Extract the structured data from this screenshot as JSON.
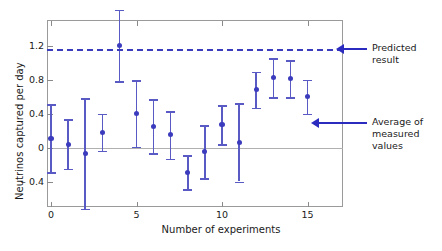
{
  "chart_data": {
    "type": "scatter",
    "title": "",
    "xlabel": "Number of experiments",
    "ylabel": "Neutrinos captured per day",
    "xlim": [
      -0.75,
      16.5
    ],
    "ylim": [
      -0.72,
      1.48
    ],
    "grid": false,
    "legend_position": "right-annotations",
    "xticks": [
      0,
      5,
      10,
      15
    ],
    "xticklabels": [
      "0",
      "5",
      "10",
      "15"
    ],
    "yticks": [
      -0.4,
      0,
      0.4,
      0.8,
      1.2
    ],
    "yticklabels": [
      "– 0.4",
      "0",
      "0.4",
      "0.8",
      "1.2"
    ],
    "x": [
      0,
      1,
      2,
      3,
      4,
      5,
      6,
      7,
      8,
      9,
      10,
      11,
      12,
      13,
      14,
      15
    ],
    "values": [
      0.11,
      0.04,
      -0.07,
      0.18,
      1.2,
      0.4,
      0.25,
      0.15,
      -0.29,
      -0.05,
      0.27,
      0.06,
      0.68,
      0.82,
      0.81,
      0.6
    ],
    "yerr": [
      0.4,
      0.29,
      0.65,
      0.22,
      0.42,
      0.39,
      0.32,
      0.28,
      0.2,
      0.31,
      0.23,
      0.46,
      0.21,
      0.23,
      0.22,
      0.2
    ],
    "reference_lines": [
      {
        "name": "predicted-result",
        "value": 1.15,
        "style": "dashed",
        "color": "#3b3bbd"
      },
      {
        "name": "average-of-measured-values",
        "value": 0.29,
        "style": "arrow",
        "color": "#2b2bc0"
      }
    ],
    "annotations": [
      {
        "name": "predicted-result-label",
        "text": "Predicted\nresult",
        "value": 1.15
      },
      {
        "name": "average-label",
        "text": "Average of\nmeasured values",
        "value": 0.29
      }
    ]
  },
  "colors": {
    "marker": "#3b3bbd",
    "errorbar": "#5a5ac4",
    "predicted_line": "#3b3bbd",
    "arrow": "#2b2bc0",
    "frame": "#9a9a9a",
    "zero_line": "#b0b0b0",
    "text": "#1a1a1a",
    "background": "#ffffff"
  }
}
